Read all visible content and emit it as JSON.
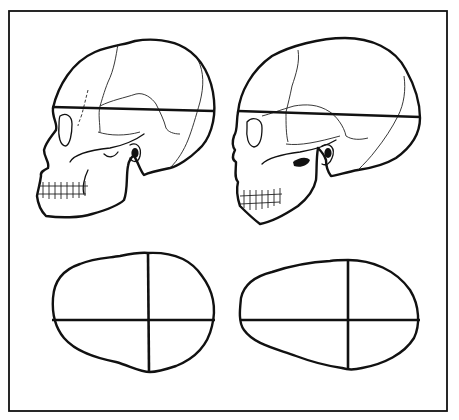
{
  "figure": {
    "title": "Comparison of skull shapes: lateral views with horizontal length line and superior outlines with length/breadth axes",
    "frame": {
      "x": 9,
      "y": 11,
      "width": 438,
      "height": 400,
      "stroke": "#111111"
    },
    "panels": [
      {
        "id": "left",
        "lateral_view": {
          "label": "Skull lateral view (rounder, shorter vault)",
          "length_line_y": 108
        },
        "superior_view": {
          "label": "Skull superior outline (nearly round)",
          "shape": "round"
        }
      },
      {
        "id": "right",
        "lateral_view": {
          "label": "Skull lateral view (longer vault)",
          "length_line_y": 116
        },
        "superior_view": {
          "label": "Skull superior outline (elongated, egg-shaped)",
          "shape": "elongated"
        }
      }
    ],
    "colors": {
      "ink": "#111111",
      "paper": "#ffffff"
    }
  }
}
